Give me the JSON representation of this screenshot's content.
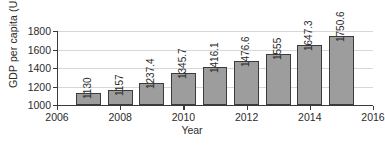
{
  "chart_data": {
    "type": "bar",
    "title": "",
    "xlabel": "Year",
    "ylabel": "GDP per capita (US$)",
    "categories": [
      2007,
      2008,
      2009,
      2010,
      2011,
      2012,
      2013,
      2014,
      2015
    ],
    "values": [
      1130,
      1157,
      1237.4,
      1345.7,
      1416.1,
      1476.6,
      1555,
      1647.3,
      1750.6
    ],
    "value_labels": [
      "1130",
      "1157",
      "1237.4",
      "1345.7",
      "1416.1",
      "1476.6",
      "1555",
      "1647.3",
      "1750.6"
    ],
    "xlim": [
      2006,
      2016
    ],
    "ylim": [
      1000,
      1800
    ],
    "xticks": [
      2006,
      2008,
      2010,
      2012,
      2014,
      2016
    ],
    "xtick_labels": [
      "2006",
      "2008",
      "2010",
      "2012",
      "2014",
      "2016"
    ],
    "yticks": [
      1000,
      1200,
      1400,
      1600,
      1800
    ],
    "ytick_labels": [
      "1000",
      "1200",
      "1400",
      "1600",
      "1800"
    ],
    "grid": true,
    "grid_axis": "y",
    "legend": false,
    "bar_fill_color": "#9d9d9d",
    "bar_edge_color": "#3b3b3b",
    "gridline_color": "#d7d7d7",
    "axis_color": "#3a3a3a",
    "value_label_rotation": 90
  }
}
